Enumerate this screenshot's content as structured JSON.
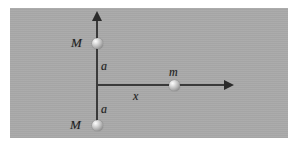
{
  "figure": {
    "background_color": "#ffffff",
    "panel_color": "#a9a9a9",
    "axis_color": "#3a3a3a",
    "label_color": "#1e1e1e"
  },
  "axes": {
    "vertical": {
      "name": "y-axis",
      "arrow_direction": "up"
    },
    "horizontal": {
      "name": "x-axis",
      "arrow_direction": "right"
    }
  },
  "masses": [
    {
      "id": "upper-M",
      "label": "M",
      "position": "above-origin",
      "distance_label": "a"
    },
    {
      "id": "lower-M",
      "label": "M",
      "position": "below-origin",
      "distance_label": "a"
    },
    {
      "id": "test-m",
      "label": "m",
      "position": "on-x-axis",
      "distance_label": "x"
    }
  ],
  "labels": {
    "mass_upper": "M",
    "mass_lower": "M",
    "mass_test": "m",
    "distance_upper": "a",
    "distance_lower": "a",
    "distance_x": "x"
  }
}
